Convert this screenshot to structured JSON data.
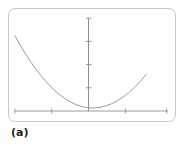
{
  "figure": {
    "caption": "(a)",
    "frame": {
      "border_color": "#c9c9c9",
      "background_color": "#ffffff",
      "corner_radius": 7
    }
  },
  "chart_data": {
    "type": "line",
    "title": "",
    "subtitle": "",
    "xlabel": "",
    "ylabel": "",
    "curve_label": "parabola",
    "line_color": "#9a9a9a",
    "axis_color": "#8e8e8e",
    "grid": false,
    "legend": null,
    "legend_position": "none",
    "axis_tick_labels_visible": false,
    "xlim": [
      -3.5,
      3.5
    ],
    "ylim": [
      -0.6,
      4.2
    ],
    "x_axis": {
      "y_value": 0,
      "start_x": -3.2,
      "end_x": 3.45,
      "ticks": [
        -3.2,
        -1.6,
        0,
        1.6,
        3.4
      ],
      "tick_labels": [
        "",
        "",
        "",
        "",
        ""
      ]
    },
    "y_axis": {
      "x_value": 0,
      "start_y": 0,
      "end_y": 4.0,
      "ticks": [
        1.0,
        2.0,
        3.0,
        4.0
      ],
      "tick_labels": [
        "",
        "",
        "",
        ""
      ]
    },
    "series": [
      {
        "name": "parabola",
        "x": [
          -3.2,
          -3.0,
          -2.75,
          -2.5,
          -2.25,
          -2.0,
          -1.75,
          -1.5,
          -1.25,
          -1.0,
          -0.75,
          -0.5,
          -0.25,
          0.0,
          0.25,
          0.5,
          0.75,
          1.0,
          1.25,
          1.5,
          1.75,
          2.0,
          2.25,
          2.5
        ],
        "y": [
          3.24,
          2.89,
          2.48,
          2.1,
          1.75,
          1.44,
          1.16,
          0.91,
          0.7,
          0.52,
          0.37,
          0.26,
          0.18,
          0.14,
          0.13,
          0.16,
          0.22,
          0.31,
          0.44,
          0.6,
          0.79,
          1.02,
          1.28,
          1.57
        ]
      }
    ],
    "vertex": {
      "x": -0.15,
      "y": 0.13
    }
  }
}
